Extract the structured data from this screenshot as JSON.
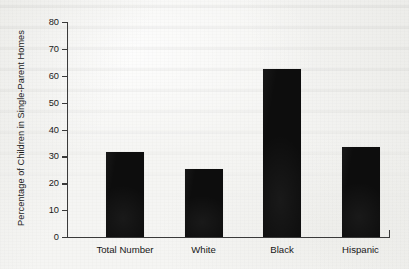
{
  "chart_data": {
    "type": "bar",
    "title": "",
    "xlabel": "",
    "ylabel": "Percentage of Children in Single-Parent Homes",
    "categories": [
      "Total Number",
      "White",
      "Black",
      "Hispanic"
    ],
    "values": [
      31.5,
      25.3,
      62.5,
      33.5
    ],
    "ylim": [
      0,
      80
    ],
    "yticks": [
      0,
      10,
      20,
      30,
      40,
      50,
      60,
      70,
      80
    ],
    "ytick_labels": [
      "0",
      "10",
      "20",
      "30",
      "40",
      "50",
      "60",
      "70",
      "80"
    ],
    "grid": false,
    "legend": null,
    "bar_color": "#0d0d0d",
    "axis_color": "#3a3a3a",
    "background_color": "#f5f5f3"
  },
  "axis": {
    "y_title": "Percentage of Children in Single-Parent Homes"
  }
}
